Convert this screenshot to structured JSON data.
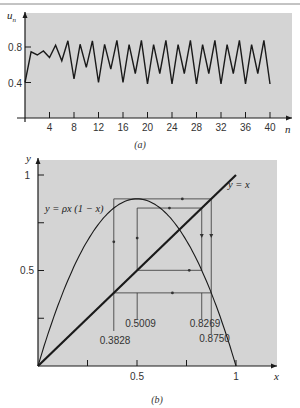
{
  "chart_data": [
    {
      "panel": "a",
      "type": "line",
      "caption": "(a)",
      "xlabel": "n",
      "ylabel": "u_n",
      "xlim": [
        0,
        40
      ],
      "ylim": [
        0,
        1
      ],
      "x_ticks": [
        4,
        8,
        12,
        16,
        20,
        24,
        28,
        32,
        36,
        40
      ],
      "x_tick_labels": [
        "4",
        "8",
        "12",
        "16",
        "20",
        "24",
        "28",
        "32",
        "36",
        "40"
      ],
      "y_ticks": [
        0.4,
        0.8
      ],
      "y_tick_labels": [
        "0.4",
        "0.8"
      ],
      "grid": false,
      "x": [
        0,
        1,
        2,
        3,
        4,
        5,
        6,
        7,
        8,
        9,
        10,
        11,
        12,
        13,
        14,
        15,
        16,
        17,
        18,
        19,
        20,
        21,
        22,
        23,
        24,
        25,
        26,
        27,
        28,
        29,
        30,
        31,
        32,
        33,
        34,
        35,
        36,
        37,
        38,
        39,
        40
      ],
      "values": [
        0.4,
        0.745,
        0.71,
        0.755,
        0.68,
        0.82,
        0.645,
        0.87,
        0.44,
        0.83,
        0.57,
        0.87,
        0.4,
        0.83,
        0.55,
        0.875,
        0.4,
        0.8269,
        0.5009,
        0.875,
        0.3828,
        0.8269,
        0.5009,
        0.875,
        0.3828,
        0.8269,
        0.5009,
        0.875,
        0.3828,
        0.8269,
        0.5009,
        0.875,
        0.3828,
        0.8269,
        0.5009,
        0.875,
        0.3828,
        0.8269,
        0.5009,
        0.875,
        0.3828
      ]
    },
    {
      "panel": "b",
      "type": "line",
      "caption": "(b)",
      "xlabel": "x",
      "ylabel": "y",
      "xlim": [
        0,
        1
      ],
      "ylim": [
        0,
        1
      ],
      "x_ticks": [
        0.25,
        0.5,
        0.75,
        1
      ],
      "x_tick_labels": [
        "",
        "0.5",
        "",
        "1"
      ],
      "y_ticks": [
        0.25,
        0.5,
        0.75,
        1
      ],
      "y_tick_labels": [
        "",
        "0.5",
        "",
        "1"
      ],
      "grid": false,
      "rho": 3.5,
      "series": [
        {
          "name": "y = ρx (1 − x)",
          "kind": "parabola"
        },
        {
          "name": "y = x",
          "kind": "diagonal"
        }
      ],
      "cycle_points": [
        0.3828,
        0.5009,
        0.8269,
        0.875
      ],
      "annotations": [
        "y = ρx (1 − x)",
        "y = x",
        "0.3828",
        "0.5009",
        "0.8269",
        "0.8750"
      ]
    }
  ],
  "labels": {
    "a_ylabel_main": "u",
    "a_ylabel_sub": "n",
    "a_xlabel": "n",
    "a_caption": "(a)",
    "a_yticks": [
      "0.8",
      "0.4"
    ],
    "a_xticks": [
      "4",
      "8",
      "12",
      "16",
      "20",
      "24",
      "28",
      "32",
      "36",
      "40"
    ],
    "b_ylabel": "y",
    "b_xlabel": "x",
    "b_caption": "(b)",
    "b_ytick_1": "1",
    "b_ytick_05": "0.5",
    "b_xtick_05": "0.5",
    "b_xtick_1": "1",
    "b_parabola_label": "y = ρx (1 − x)",
    "b_diag_label": "y = x",
    "b_cycle_labels": [
      "0.3828",
      "0.5009",
      "0.8269",
      "0.8750"
    ]
  },
  "colors": {
    "plot_bg": "#d4d4d4",
    "line": "#1a1a1a",
    "text": "#333333"
  }
}
